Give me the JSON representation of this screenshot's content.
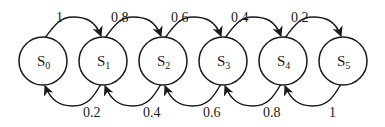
{
  "diagram": {
    "type": "state-transition",
    "nodes": [
      {
        "id": "S0",
        "base": "S",
        "sub": "0",
        "cx": 43
      },
      {
        "id": "S1",
        "base": "S",
        "sub": "1",
        "cx": 103
      },
      {
        "id": "S2",
        "base": "S",
        "sub": "2",
        "cx": 163
      },
      {
        "id": "S3",
        "base": "S",
        "sub": "3",
        "cx": 223
      },
      {
        "id": "S4",
        "base": "S",
        "sub": "4",
        "cx": 283
      },
      {
        "id": "S5",
        "base": "S",
        "sub": "5",
        "cx": 343
      }
    ],
    "forward_edges": [
      {
        "from": "S0",
        "to": "S1",
        "label": "1"
      },
      {
        "from": "S1",
        "to": "S2",
        "label": "0.8"
      },
      {
        "from": "S2",
        "to": "S3",
        "label": "0.6"
      },
      {
        "from": "S3",
        "to": "S4",
        "label": "0.4"
      },
      {
        "from": "S4",
        "to": "S5",
        "label": "0.2"
      }
    ],
    "backward_edges": [
      {
        "from": "S1",
        "to": "S0",
        "label": "0.2"
      },
      {
        "from": "S2",
        "to": "S1",
        "label": "0.4"
      },
      {
        "from": "S3",
        "to": "S2",
        "label": "0.6"
      },
      {
        "from": "S4",
        "to": "S3",
        "label": "0.8"
      },
      {
        "from": "S5",
        "to": "S4",
        "label": "1"
      }
    ],
    "colors": {
      "stroke": "#1a1a1a",
      "background": "#ffffff"
    }
  }
}
